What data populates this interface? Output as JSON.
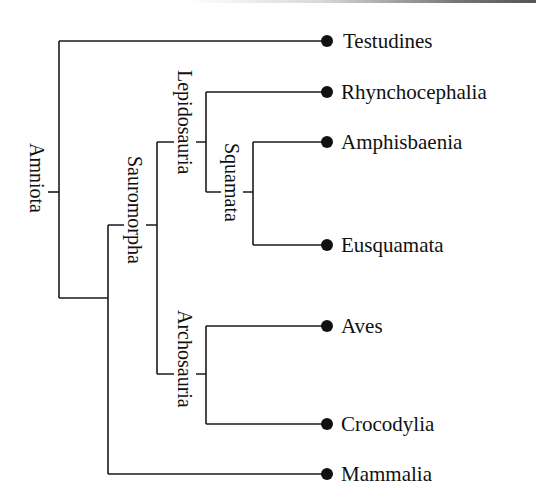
{
  "diagram": {
    "type": "cladogram",
    "root": "Amniota",
    "leaves": [
      {
        "name": "Testudines"
      },
      {
        "name": "Rhynchocephalia"
      },
      {
        "name": "Amphisbaenia"
      },
      {
        "name": "Eusquamata"
      },
      {
        "name": "Aves"
      },
      {
        "name": "Crocodylia"
      },
      {
        "name": "Mammalia"
      }
    ],
    "clades": [
      {
        "name": "Amniota",
        "members": [
          "Testudines",
          "Rhynchocephalia",
          "Amphisbaenia",
          "Eusquamata",
          "Aves",
          "Crocodylia",
          "Mammalia"
        ]
      },
      {
        "name": "Sauromorpha",
        "members": [
          "Rhynchocephalia",
          "Amphisbaenia",
          "Eusquamata",
          "Aves",
          "Crocodylia"
        ]
      },
      {
        "name": "Lepidosauria",
        "members": [
          "Rhynchocephalia",
          "Amphisbaenia",
          "Eusquamata"
        ]
      },
      {
        "name": "Squamata",
        "members": [
          "Amphisbaenia",
          "Eusquamata"
        ]
      },
      {
        "name": "Archosauria",
        "members": [
          "Aves",
          "Crocodylia"
        ]
      }
    ],
    "labels": {
      "amniota": "Amniota",
      "sauromorpha": "Sauromorpha",
      "lepidosauria": "Lepidosauria",
      "squamata": "Squamata",
      "archosauria": "Archosauria"
    },
    "colors": {
      "line": "#1a1a1a",
      "dot": "#111111",
      "background": "#ffffff"
    }
  }
}
